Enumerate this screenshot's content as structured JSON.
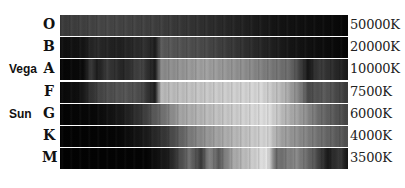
{
  "figure": {
    "rows": [
      {
        "star": "",
        "class": "O",
        "temperature": "50000K"
      },
      {
        "star": "",
        "class": "B",
        "temperature": "20000K"
      },
      {
        "star": "Vega",
        "class": "A",
        "temperature": "10000K"
      },
      {
        "star": "",
        "class": "F",
        "temperature": "7500K"
      },
      {
        "star": "Sun",
        "class": "G",
        "temperature": "6000K"
      },
      {
        "star": "",
        "class": "K",
        "temperature": "4000K"
      },
      {
        "star": "",
        "class": "M",
        "temperature": "3500K"
      }
    ]
  }
}
